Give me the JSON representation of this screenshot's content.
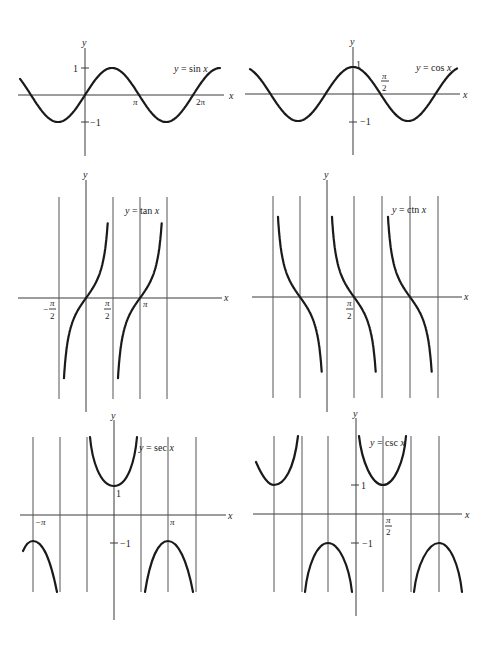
{
  "figure": {
    "colors": {
      "ink": "#1a1a1a",
      "axis": "#3a3a3a",
      "background": "#ffffff"
    },
    "axis_labels": {
      "x": "x",
      "y": "y"
    }
  },
  "chart_data": [
    {
      "type": "line",
      "title": "y = sin x",
      "label": "y = sin x",
      "xlabel": "x",
      "ylabel": "y",
      "x_ticks": [
        "π",
        "2π"
      ],
      "y_ticks": [
        "1",
        "−1"
      ],
      "xlim": [
        -1.2,
        6.8
      ],
      "ylim": [
        -1,
        1
      ],
      "grid": false,
      "function": "sin",
      "origin_px": [
        85,
        95
      ],
      "unit_px": 17.2,
      "amp_px": 27,
      "xrange_px": [
        20,
        220
      ]
    },
    {
      "type": "line",
      "title": "y = cos x",
      "label": "y = cos x",
      "xlabel": "x",
      "ylabel": "y",
      "x_ticks": [
        "π/2"
      ],
      "y_ticks": [
        "1",
        "−1"
      ],
      "xlim": [
        -6,
        6
      ],
      "ylim": [
        -1,
        1
      ],
      "grid": false,
      "function": "cos",
      "origin_px": [
        353,
        94
      ],
      "unit_px": 17.5,
      "amp_px": 27,
      "xrange_px": [
        250,
        457
      ]
    },
    {
      "type": "line",
      "title": "y = tan x",
      "label": "y = tan x",
      "xlabel": "x",
      "ylabel": "y",
      "x_ticks": [
        "−π/2",
        "π/2",
        "π"
      ],
      "asymptotes": [
        "−π/2",
        "π/2",
        "3π/2"
      ],
      "vertical_lines_px": [
        59,
        113,
        140,
        167
      ],
      "zeros": [
        "0",
        "π"
      ],
      "grid": false,
      "function": "tan"
    },
    {
      "type": "line",
      "title": "y = ctn x",
      "label": "y = ctn x",
      "xlabel": "x",
      "ylabel": "y",
      "x_ticks": [
        "π/2"
      ],
      "asymptotes": [
        "−π",
        "0",
        "π",
        "2π"
      ],
      "vertical_lines_px": [
        273,
        300,
        354,
        382,
        410,
        438
      ],
      "zeros": [
        "−π/2",
        "π/2",
        "3π/2"
      ],
      "grid": false,
      "function": "cot"
    },
    {
      "type": "line",
      "title": "y = sec x",
      "label": "y = sec x",
      "xlabel": "x",
      "ylabel": "y",
      "x_ticks": [
        "−π",
        "π"
      ],
      "y_ticks": [
        "1",
        "−1"
      ],
      "vertical_lines_px": [
        33,
        60,
        87,
        141,
        168,
        196
      ],
      "grid": false,
      "function": "sec"
    },
    {
      "type": "line",
      "title": "y = csc x",
      "label": "y = csc x",
      "xlabel": "x",
      "ylabel": "y",
      "x_ticks": [
        "π/2"
      ],
      "y_ticks": [
        "1",
        "−1"
      ],
      "vertical_lines_px": [
        274,
        302,
        328,
        383,
        411,
        439
      ],
      "grid": false,
      "function": "csc"
    }
  ],
  "labels": {
    "sin": {
      "eq_y": "y",
      "eq_rest": " = sin ",
      "eq_x": "x",
      "pi": "π",
      "two_pi": "2π",
      "one": "1",
      "neg_one": "−1"
    },
    "cos": {
      "eq_y": "y",
      "eq_rest": " = cos ",
      "eq_x": "x",
      "pi": "π",
      "two": "2",
      "one": "1",
      "neg_one": "−1"
    },
    "tan": {
      "eq_y": "y",
      "eq_rest": " = tan ",
      "eq_x": "x",
      "neg": "−",
      "pi": "π",
      "two": "2"
    },
    "ctn": {
      "eq_y": "y",
      "eq_rest": " = ctn ",
      "eq_x": "x",
      "pi": "π",
      "two": "2"
    },
    "sec": {
      "eq_y": "y",
      "eq_rest": " = sec ",
      "eq_x": "x",
      "neg_pi": "−π",
      "pi": "π",
      "one": "1",
      "neg_one": "−1"
    },
    "csc": {
      "eq_y": "y",
      "eq_rest": " = csc ",
      "eq_x": "x",
      "pi": "π",
      "two": "2",
      "one": "1",
      "neg_one": "−1"
    }
  }
}
